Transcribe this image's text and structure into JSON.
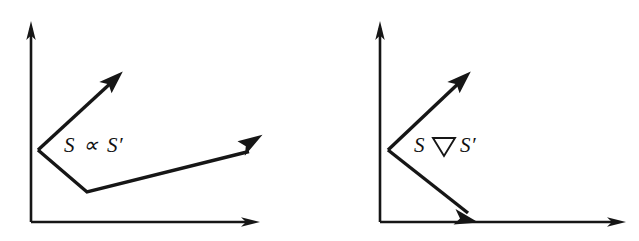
{
  "figure": {
    "background_color": "#ffffff",
    "ink_color": "#161616",
    "width": 639,
    "height": 241,
    "panels": [
      {
        "id": "left-panel",
        "label_text_parts": {
          "left_operand": "S",
          "operator": "∝",
          "operator_name": "proportional-to-symbol",
          "right_operand": "S′"
        },
        "label_full": "S ∝ S′",
        "label_position": {
          "x": 64,
          "y": 145
        },
        "axes": {
          "origin": {
            "x": 31,
            "y": 222
          },
          "y_axis_tip": {
            "x": 31,
            "y": 22
          },
          "x_axis_tip": {
            "x": 259,
            "y": 222
          }
        },
        "vectors": [
          {
            "name": "upper-vector",
            "start": {
              "x": 38,
              "y": 150
            },
            "end": {
              "x": 122,
              "y": 72
            }
          },
          {
            "name": "lower-vector",
            "start": {
              "x": 38,
              "y": 150
            },
            "bend": {
              "x": 87,
              "y": 192
            },
            "end": {
              "x": 262,
              "y": 135
            }
          }
        ]
      },
      {
        "id": "right-panel",
        "label_text_parts": {
          "left_operand": "S",
          "operator": "▽",
          "operator_name": "nabla-open-down-triangle-symbol",
          "right_operand": "S′"
        },
        "label_full": "S ▽ S′",
        "label_position": {
          "x": 414,
          "y": 145
        },
        "axes": {
          "origin": {
            "x": 380,
            "y": 222
          },
          "y_axis_tip": {
            "x": 380,
            "y": 22
          },
          "x_axis_tip": {
            "x": 625,
            "y": 222
          }
        },
        "vectors": [
          {
            "name": "upper-vector",
            "start": {
              "x": 388,
              "y": 150
            },
            "end": {
              "x": 470,
              "y": 72
            }
          },
          {
            "name": "lower-vector",
            "start": {
              "x": 388,
              "y": 150
            },
            "end": {
              "x": 478,
              "y": 222
            }
          }
        ]
      }
    ]
  }
}
